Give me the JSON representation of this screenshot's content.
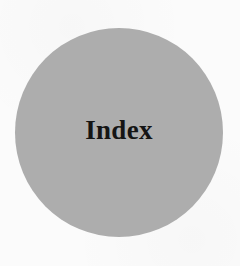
{
  "section": {
    "title": "Index",
    "circle_color": "#adadad"
  }
}
